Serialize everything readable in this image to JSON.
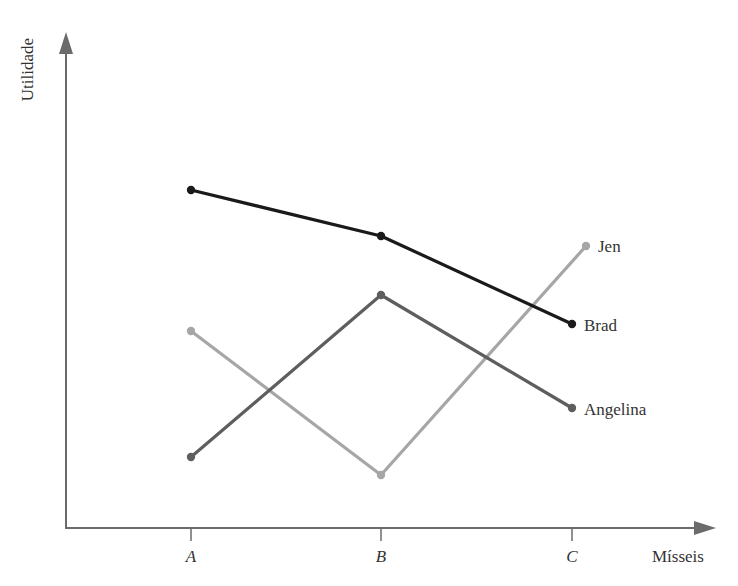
{
  "chart_data": {
    "type": "line",
    "title": "",
    "xlabel": "Mísseis",
    "ylabel": "Utilidade",
    "categories": [
      "A",
      "B",
      "C"
    ],
    "grid": false,
    "legend_position": "inline-right",
    "series": [
      {
        "name": "Brad",
        "values": [
          6.4,
          5.7,
          4.3
        ],
        "color": "#1a1a1a",
        "px": [
          [
            191,
            190
          ],
          [
            381,
            236
          ],
          [
            572,
            324
          ]
        ],
        "label_pos": [
          584,
          331
        ]
      },
      {
        "name": "Angelina",
        "values": [
          1.1,
          3.6,
          1.9
        ],
        "color": "#5e5e5e",
        "px": [
          [
            191,
            457
          ],
          [
            381,
            295
          ],
          [
            572,
            408
          ]
        ],
        "label_pos": [
          584,
          415
        ]
      },
      {
        "name": "Jen",
        "values": [
          3.0,
          0.8,
          4.1
        ],
        "color": "#a6a6a6",
        "px": [
          [
            191,
            331
          ],
          [
            381,
            475
          ],
          [
            586,
            246
          ]
        ],
        "label_pos": [
          598,
          252
        ]
      }
    ],
    "axis": {
      "origin": [
        66,
        528
      ],
      "x_end": 716,
      "y_end": 32,
      "tick_x": [
        191,
        381,
        572
      ],
      "color": "#6b6b6b"
    }
  }
}
